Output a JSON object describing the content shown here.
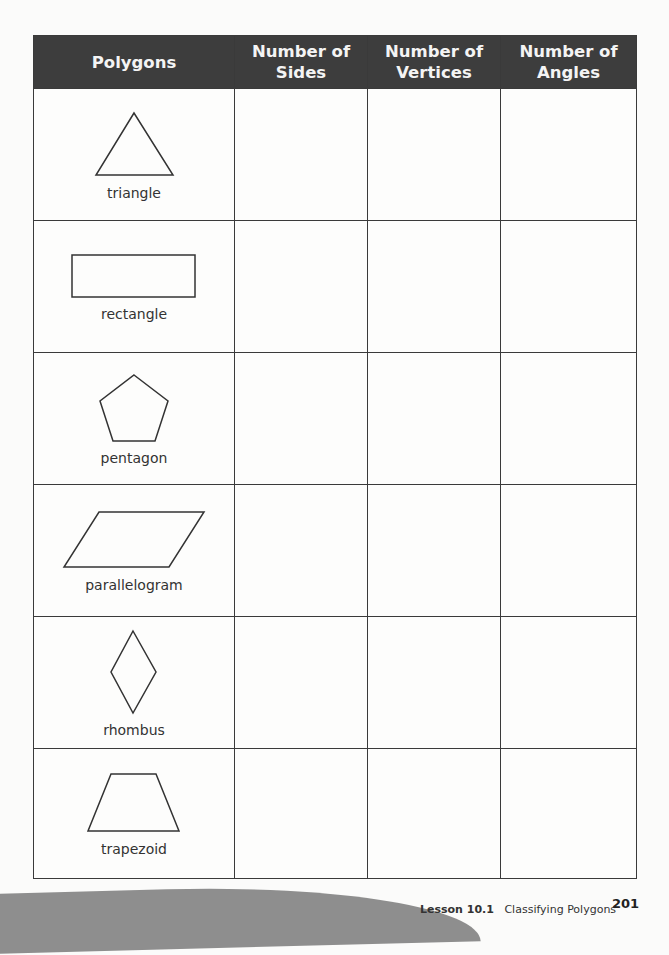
{
  "table": {
    "headers": [
      {
        "line1": "Polygons",
        "line2": ""
      },
      {
        "line1": "Number of",
        "line2": "Sides"
      },
      {
        "line1": "Number of",
        "line2": "Vertices"
      },
      {
        "line1": "Number of",
        "line2": "Angles"
      }
    ],
    "rows": [
      {
        "name": "triangle",
        "shape_icon": "triangle-shape",
        "sides": "",
        "vertices": "",
        "angles": ""
      },
      {
        "name": "rectangle",
        "shape_icon": "rectangle-shape",
        "sides": "",
        "vertices": "",
        "angles": ""
      },
      {
        "name": "pentagon",
        "shape_icon": "pentagon-shape",
        "sides": "",
        "vertices": "",
        "angles": ""
      },
      {
        "name": "parallelogram",
        "shape_icon": "parallelogram-shape",
        "sides": "",
        "vertices": "",
        "angles": ""
      },
      {
        "name": "rhombus",
        "shape_icon": "rhombus-shape",
        "sides": "",
        "vertices": "",
        "angles": ""
      },
      {
        "name": "trapezoid",
        "shape_icon": "trapezoid-shape",
        "sides": "",
        "vertices": "",
        "angles": ""
      }
    ]
  },
  "footer": {
    "lesson_label": "Lesson 10.1",
    "lesson_title": "Classifying Polygons",
    "page_number": "201"
  },
  "colors": {
    "header_bg": "#3d3d3d",
    "header_text": "#f4f4f4",
    "border": "#3a3a3a"
  }
}
